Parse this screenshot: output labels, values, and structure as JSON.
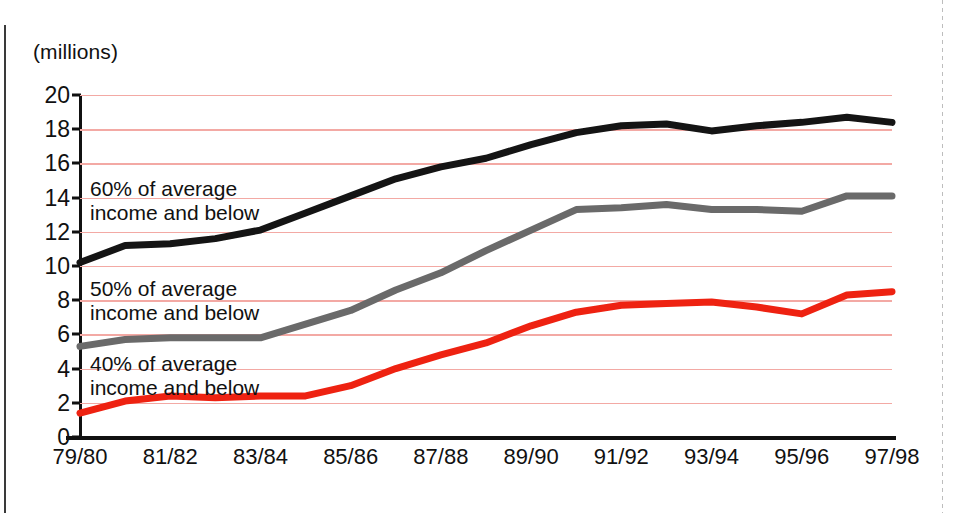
{
  "axis": {
    "units_label": "(millions)",
    "y_ticks": [
      0,
      2,
      4,
      6,
      8,
      10,
      12,
      14,
      16,
      18,
      20
    ],
    "x_tick_labels": [
      "79/80",
      "81/82",
      "83/84",
      "85/86",
      "87/88",
      "89/90",
      "91/92",
      "93/94",
      "95/96",
      "97/98"
    ]
  },
  "annotations": {
    "s60_line1": "60% of average",
    "s60_line2": "income and below",
    "s50_line1": "50% of average",
    "s50_line2": "income and below",
    "s40_line1": "40% of average",
    "s40_line2": "income and below"
  },
  "colors": {
    "series_60": "#141414",
    "series_50": "#6a6a6a",
    "series_40": "#ee2211",
    "gridline": "#f3a9a4",
    "axis": "#111111"
  },
  "chart_data": {
    "type": "line",
    "title": "",
    "xlabel": "",
    "ylabel": "(millions)",
    "ylim": [
      0,
      20
    ],
    "ytick_step": 2,
    "grid": true,
    "legend": "inline-annotations",
    "x": [
      "79/80",
      "80/81",
      "81/82",
      "82/83",
      "83/84",
      "84/85",
      "85/86",
      "86/87",
      "87/88",
      "88/89",
      "89/90",
      "90/91",
      "91/92",
      "92/93",
      "93/94",
      "94/95",
      "95/96",
      "96/97",
      "97/98"
    ],
    "series": [
      {
        "name": "60% of average income and below",
        "color": "#141414",
        "values": [
          10.2,
          11.2,
          11.3,
          11.6,
          12.1,
          13.1,
          14.1,
          15.1,
          15.8,
          16.3,
          17.1,
          17.8,
          18.2,
          18.3,
          17.9,
          18.2,
          18.4,
          18.7,
          18.4
        ]
      },
      {
        "name": "50% of average income and below",
        "color": "#6a6a6a",
        "values": [
          5.3,
          5.7,
          5.8,
          5.8,
          5.8,
          6.6,
          7.4,
          8.6,
          9.6,
          10.9,
          12.1,
          13.3,
          13.4,
          13.6,
          13.3,
          13.3,
          13.2,
          14.1,
          14.1
        ]
      },
      {
        "name": "40% of average income and below",
        "color": "#ee2211",
        "values": [
          1.4,
          2.1,
          2.4,
          2.3,
          2.4,
          2.4,
          3.0,
          4.0,
          4.8,
          5.5,
          6.5,
          7.3,
          7.7,
          7.8,
          7.9,
          7.6,
          7.2,
          8.3,
          8.5
        ]
      }
    ]
  }
}
